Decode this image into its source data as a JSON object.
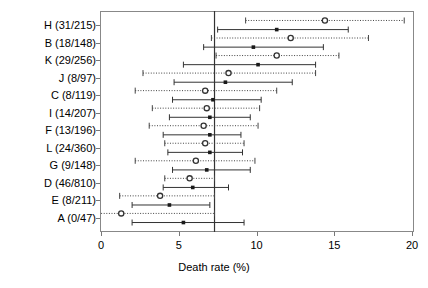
{
  "chart_data": {
    "type": "scatter",
    "title": "",
    "xlabel": "Death rate (%)",
    "ylabel": "",
    "xlim": [
      0,
      20
    ],
    "xticks": [
      0,
      5,
      10,
      15,
      20
    ],
    "xticklabels": [
      "0",
      "5",
      "10",
      "15",
      "20"
    ],
    "grid": false,
    "legend": "none",
    "reference_line": {
      "value": 7.3,
      "style": "solid",
      "color": "#333333",
      "orientation": "vertical"
    },
    "categories": [
      "H (31/215)",
      "B (18/148)",
      "K (29/256)",
      "J (8/97)",
      "C (8/119)",
      "I (14/207)",
      "F (13/196)",
      "L (24/360)",
      "G (9/148)",
      "D (46/810)",
      "E (8/211)",
      "A (0/47)"
    ],
    "series": [
      {
        "name": "observed",
        "marker": "open-circle",
        "line_style": "dotted",
        "color": "#444444",
        "points": [
          {
            "category": "H (31/215)",
            "value": 14.4,
            "low": 9.3,
            "high": 19.5
          },
          {
            "category": "B (18/148)",
            "value": 12.2,
            "low": 7.1,
            "high": 17.2
          },
          {
            "category": "K (29/256)",
            "value": 11.3,
            "low": 7.4,
            "high": 15.3
          },
          {
            "category": "J (8/97)",
            "value": 8.2,
            "low": 2.7,
            "high": 13.8
          },
          {
            "category": "C (8/119)",
            "value": 6.7,
            "low": 2.2,
            "high": 11.3
          },
          {
            "category": "I (14/207)",
            "value": 6.8,
            "low": 3.3,
            "high": 10.2
          },
          {
            "category": "F (13/196)",
            "value": 6.6,
            "low": 3.1,
            "high": 10.1
          },
          {
            "category": "L (24/360)",
            "value": 6.7,
            "low": 4.1,
            "high": 9.2
          },
          {
            "category": "G (9/148)",
            "value": 6.1,
            "low": 2.2,
            "high": 9.9
          },
          {
            "category": "D (46/810)",
            "value": 5.7,
            "low": 4.1,
            "high": 7.3
          },
          {
            "category": "E (8/211)",
            "value": 3.8,
            "low": 1.2,
            "high": 7.3
          },
          {
            "category": "A (0/47)",
            "value": 1.3,
            "low": -2.0,
            "high": 7.3
          }
        ]
      },
      {
        "name": "adjusted",
        "marker": "filled-square",
        "line_style": "solid",
        "color": "#333333",
        "points": [
          {
            "category": "H (31/215)",
            "value": 11.3,
            "low": 7.5,
            "high": 15.9
          },
          {
            "category": "B (18/148)",
            "value": 9.8,
            "low": 6.6,
            "high": 14.3
          },
          {
            "category": "K (29/256)",
            "value": 10.1,
            "low": 5.3,
            "high": 13.8
          },
          {
            "category": "J (8/97)",
            "value": 8.0,
            "low": 4.7,
            "high": 12.3
          },
          {
            "category": "C (8/119)",
            "value": 7.2,
            "low": 4.6,
            "high": 10.3
          },
          {
            "category": "I (14/207)",
            "value": 7.0,
            "low": 4.4,
            "high": 9.6
          },
          {
            "category": "F (13/196)",
            "value": 7.0,
            "low": 4.0,
            "high": 9.0
          },
          {
            "category": "L (24/360)",
            "value": 7.0,
            "low": 4.3,
            "high": 9.1
          },
          {
            "category": "G (9/148)",
            "value": 6.8,
            "low": 4.6,
            "high": 9.6
          },
          {
            "category": "D (46/810)",
            "value": 5.9,
            "low": 4.0,
            "high": 8.2
          },
          {
            "category": "E (8/211)",
            "value": 4.4,
            "low": 2.0,
            "high": 7.0
          },
          {
            "category": "A (0/47)",
            "value": 5.3,
            "low": 2.0,
            "high": 9.2
          }
        ]
      }
    ]
  }
}
